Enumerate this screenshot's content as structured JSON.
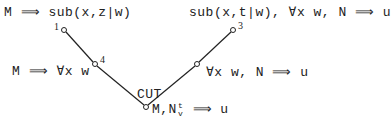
{
  "diagram": {
    "type": "proof-tree",
    "nodes": [
      {
        "id": "1",
        "label": "1",
        "formula": "M ⟹ sub(x,z|w)",
        "x": 64,
        "y": 30
      },
      {
        "id": "3",
        "label": "3",
        "formula": "sub(x,t|w), ∀x w, N ⟹ u",
        "x": 233,
        "y": 30
      },
      {
        "id": "4",
        "label": "4",
        "formula": "M ⟹ ∀x w",
        "x": 95,
        "y": 64
      },
      {
        "id": "r",
        "label": "",
        "formula": "∀x w, N ⟹ u",
        "x": 197,
        "y": 64
      },
      {
        "id": "cut",
        "label": "",
        "formula": "M,N",
        "formula_sup": "t",
        "formula_sub": "v",
        "formula_tail": " ⟹ u",
        "x": 146,
        "y": 107
      }
    ],
    "edges": [
      {
        "from": "1",
        "to": "4"
      },
      {
        "from": "3",
        "to": "r"
      },
      {
        "from": "4",
        "to": "cut"
      },
      {
        "from": "r",
        "to": "cut"
      }
    ],
    "rule_label": "CUT",
    "colors": {
      "line": "#222222",
      "text": "#222222",
      "background": "#ffffff"
    }
  }
}
